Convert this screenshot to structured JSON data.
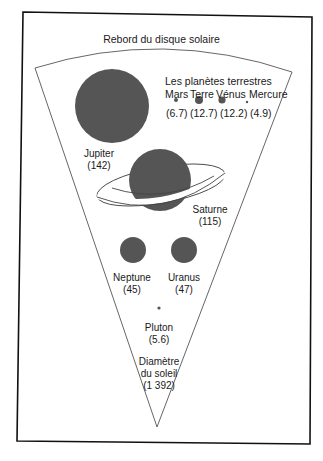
{
  "title": "Rebord du disque solaire",
  "terrestrial": {
    "heading": "Les planètes terrestres",
    "planets": [
      {
        "name": "Mars",
        "diameter": "(6.7)"
      },
      {
        "name": "Terre",
        "diameter": "(12.7)"
      },
      {
        "name": "Vénus",
        "diameter": "(12.2)"
      },
      {
        "name": "Mercure",
        "diameter": "(4.9)"
      }
    ]
  },
  "giants": {
    "jupiter": {
      "name": "Jupiter",
      "diameter": "(142)"
    },
    "saturne": {
      "name": "Saturne",
      "diameter": "(115)"
    },
    "neptune": {
      "name": "Neptune",
      "diameter": "(45)"
    },
    "uranus": {
      "name": "Uranus",
      "diameter": "(47)"
    },
    "pluton": {
      "name": "Pluton",
      "diameter": "(5.6)"
    }
  },
  "sun": {
    "line1": "Diamètre",
    "line2": "du soleil",
    "diameter": "(1 392)"
  },
  "colors": {
    "planet": "#555555",
    "line": "#444444",
    "frame": "#111111"
  }
}
